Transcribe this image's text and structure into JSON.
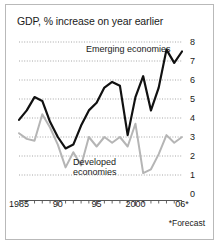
{
  "chart_data": {
    "type": "line",
    "title": "GDP, % increase on year earlier",
    "xlabel": "",
    "ylabel": "",
    "ylim": [
      0,
      8
    ],
    "yticks": [
      0,
      1,
      2,
      3,
      4,
      5,
      6,
      7,
      8
    ],
    "ytick_labels": [
      "0",
      "1",
      "2",
      "3",
      "4",
      "5",
      "6",
      "7",
      "8"
    ],
    "xlim": [
      1985,
      2006
    ],
    "xticks": [
      1985,
      1990,
      1995,
      2000,
      2006
    ],
    "xtick_labels": [
      "1985",
      "90",
      "95",
      "2000",
      "06*"
    ],
    "grid": "horizontal-dotted",
    "legend": "inline-annotations",
    "x": [
      1985,
      1986,
      1987,
      1988,
      1989,
      1990,
      1991,
      1992,
      1993,
      1994,
      1995,
      1996,
      1997,
      1998,
      1999,
      2000,
      2001,
      2002,
      2003,
      2004,
      2005,
      2006
    ],
    "series": [
      {
        "name": "Emerging economies",
        "color": "#111111",
        "values": [
          3.9,
          4.4,
          5.1,
          4.9,
          3.8,
          3.0,
          2.4,
          2.6,
          3.6,
          4.4,
          4.8,
          5.6,
          5.9,
          5.7,
          3.1,
          5.1,
          6.2,
          4.4,
          5.6,
          7.6,
          6.9,
          7.5
        ]
      },
      {
        "name": "Developed economies",
        "color": "#b5b5b5",
        "values": [
          3.2,
          2.9,
          2.8,
          4.2,
          3.5,
          2.6,
          1.4,
          2.2,
          1.5,
          3.0,
          2.5,
          3.0,
          2.7,
          3.0,
          2.5,
          3.7,
          1.1,
          1.3,
          2.1,
          3.1,
          2.7,
          3.0
        ]
      }
    ],
    "annotations": [
      {
        "text": "Emerging economies",
        "x": 1997,
        "y": 7.6
      },
      {
        "text": "Developed",
        "x": 1994,
        "y": 1.9
      },
      {
        "text": "economies",
        "x": 1994,
        "y": 1.4
      }
    ],
    "footnote": "*Forecast"
  },
  "chart": {
    "title": "GDP, % increase on year earlier",
    "footnote": "*Forecast",
    "label_emerging": "Emerging economies",
    "label_developed_line1": "Developed",
    "label_developed_line2": "economies",
    "colors": {
      "emerging": "#111111",
      "developed": "#b5b5b5",
      "grid": "#909090",
      "axis": "#555555",
      "border": "#b9b9b9",
      "background": "#ffffff",
      "text": "#1a1a1a"
    }
  }
}
